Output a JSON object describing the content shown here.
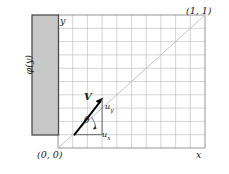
{
  "figure": {
    "domain": {
      "origin_label": "(0, 0)",
      "corner_label": "(1, 1)",
      "x_axis_label": "x",
      "y_axis_label": "y",
      "grid_divisions_x": 10,
      "grid_divisions_y": 10
    },
    "boundary": {
      "label": "φ(y)",
      "fill_color": "#c8c8c8",
      "edge_color": "#4d4d4d"
    },
    "vector": {
      "label": "V",
      "angle_label": "θ",
      "component_y_label": "u",
      "component_y_sub": "y",
      "component_x_label": "u",
      "component_x_sub": "x",
      "color": "#000000"
    },
    "diagonal": {
      "color": "#bdbdbd"
    },
    "grid": {
      "line_color": "#b0b0b0",
      "frame_color": "#8a8a8a"
    }
  }
}
